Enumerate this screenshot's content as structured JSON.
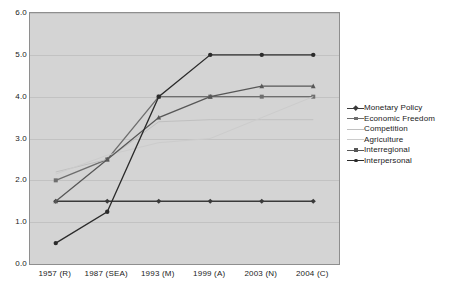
{
  "chart_data": {
    "type": "line",
    "title": "",
    "subtitle": "",
    "xlabel": "",
    "ylabel": "",
    "ylim": [
      0.0,
      6.0
    ],
    "ytick_labels": [
      "6.0",
      "5.0",
      "4.0",
      "3.0",
      "2.0",
      "1.0",
      "0.0"
    ],
    "ytick_values": [
      6.0,
      5.0,
      4.0,
      3.0,
      2.0,
      1.0,
      0.0
    ],
    "grid": true,
    "legend_position": "right",
    "categories": [
      "1957 (R)",
      "1987 (SEA)",
      "1993 (M)",
      "1999 (A)",
      "2003 (N)",
      "2004 (C)"
    ],
    "series": [
      {
        "name": "Monetary Policy",
        "color": "#3a3a3a",
        "marker": "diamond",
        "values": [
          1.5,
          1.5,
          1.5,
          1.5,
          1.5,
          1.5
        ]
      },
      {
        "name": "Economic Freedom",
        "color": "#6e6e6e",
        "marker": "square",
        "values": [
          2.0,
          2.5,
          4.0,
          4.0,
          4.0,
          4.0
        ]
      },
      {
        "name": "Competition",
        "color": "#c0c0c0",
        "marker": "none",
        "values": [
          2.2,
          2.5,
          3.4,
          3.45,
          3.45,
          3.45
        ]
      },
      {
        "name": "Agriculture",
        "color": "#cccccc",
        "marker": "none",
        "values": [
          2.15,
          2.6,
          2.9,
          3.0,
          3.5,
          4.0
        ]
      },
      {
        "name": "Interregional",
        "color": "#575757",
        "marker": "triangle",
        "values": [
          1.5,
          2.5,
          3.5,
          4.0,
          4.25,
          4.25
        ]
      },
      {
        "name": "Interpersonal",
        "color": "#2b2b2b",
        "marker": "circle",
        "values": [
          0.5,
          1.25,
          4.0,
          5.0,
          5.0,
          5.0
        ]
      }
    ]
  },
  "legend": {
    "items": [
      {
        "label": "Monetary Policy"
      },
      {
        "label": "Economic Freedom"
      },
      {
        "label": "Competition"
      },
      {
        "label": "Agriculture"
      },
      {
        "label": "Interregional"
      },
      {
        "label": "Interpersonal"
      }
    ]
  },
  "colors": {
    "plot_background": "#d4d4d4",
    "plot_border": "#8e8e8e",
    "gridline": "#c2c2c2",
    "page_background": "#ffffff",
    "text": "#1a1a1a"
  }
}
